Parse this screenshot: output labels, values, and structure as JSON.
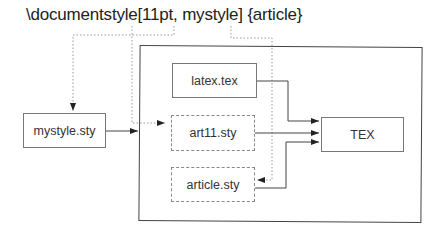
{
  "diagram": {
    "title": "\\documentstyle[11pt, mystyle] {article}",
    "nodes": [
      {
        "id": "mystyle",
        "label": "mystyle.sty",
        "style": "solid"
      },
      {
        "id": "latex",
        "label": "latex.tex",
        "style": "solid"
      },
      {
        "id": "art11",
        "label": "art11.sty",
        "style": "dashed"
      },
      {
        "id": "article",
        "label": "article.sty",
        "style": "dashed"
      },
      {
        "id": "tex",
        "label": "TEX",
        "style": "solid"
      }
    ],
    "edges": [
      {
        "from": "title:mystyle",
        "to": "mystyle",
        "style": "dotted"
      },
      {
        "from": "title:11pt",
        "to": "art11",
        "style": "dotted"
      },
      {
        "from": "title:article",
        "to": "article",
        "style": "dotted"
      },
      {
        "from": "mystyle",
        "to": "container",
        "style": "solid"
      },
      {
        "from": "latex",
        "to": "tex",
        "style": "solid"
      },
      {
        "from": "art11",
        "to": "tex",
        "style": "solid"
      },
      {
        "from": "article",
        "to": "tex",
        "style": "solid"
      }
    ]
  }
}
